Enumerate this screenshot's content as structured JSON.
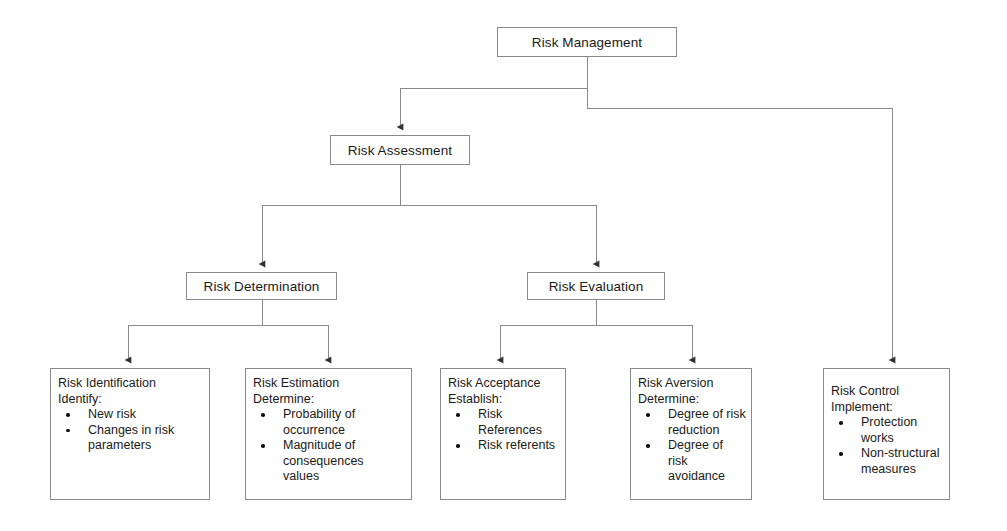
{
  "diagram": {
    "title": "Risk Management",
    "line_color": "#8a8a8a",
    "text_color": "#1a1a1a",
    "background": "#ffffff"
  },
  "nodes": {
    "risk_management": {
      "label": "Risk Management"
    },
    "risk_assessment": {
      "label": "Risk Assessment"
    },
    "risk_determination": {
      "label": "Risk Determination"
    },
    "risk_evaluation": {
      "label": "Risk Evaluation"
    },
    "risk_identification": {
      "title": "Risk Identification",
      "subtitle": "Identify:",
      "bullets": [
        "New risk",
        "Changes in risk parameters"
      ]
    },
    "risk_estimation": {
      "title": "Risk Estimation",
      "subtitle": "Determine:",
      "bullets": [
        "Probability of occurrence",
        "Magnitude of consequences values"
      ]
    },
    "risk_acceptance": {
      "title": "Risk Acceptance",
      "subtitle": "Establish:",
      "bullets": [
        "Risk References",
        "Risk referents"
      ]
    },
    "risk_aversion": {
      "title": "Risk Aversion",
      "subtitle": "Determine:",
      "bullets": [
        "Degree of risk reduction",
        "Degree of risk avoidance"
      ]
    },
    "risk_control": {
      "title": "Risk Control",
      "subtitle": "Implement:",
      "bullets": [
        "Protection works",
        "Non-structural measures"
      ]
    }
  }
}
